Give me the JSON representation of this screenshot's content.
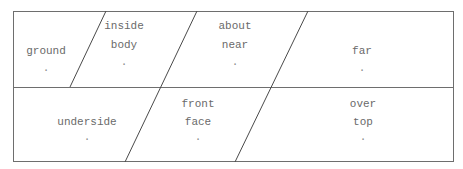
{
  "diagram": {
    "stroke_color": "#6e6e6e",
    "rows": [
      {
        "cells": [
          {
            "lines": [
              "",
              "ground",
              "."
            ],
            "cx": 46,
            "cy": 52
          },
          {
            "lines": [
              "inside",
              "body",
              "."
            ],
            "cx": 124,
            "cy": 52
          },
          {
            "lines": [
              "about",
              "near",
              "."
            ],
            "cx": 235,
            "cy": 52
          },
          {
            "lines": [
              "",
              "far",
              "."
            ],
            "cx": 362,
            "cy": 52
          }
        ]
      },
      {
        "cells": [
          {
            "lines": [
              "",
              "underside",
              "."
            ],
            "cx": 87,
            "cy": 127
          },
          {
            "lines": [
              "front",
              "face",
              "."
            ],
            "cx": 198,
            "cy": 127
          },
          {
            "lines": [
              "over",
              "top",
              "."
            ],
            "cx": 363,
            "cy": 127
          }
        ]
      }
    ]
  }
}
